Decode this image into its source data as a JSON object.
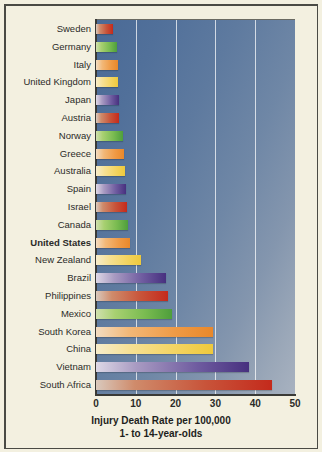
{
  "chart_data": {
    "type": "bar",
    "orientation": "horizontal",
    "title": "",
    "xlabel": "Injury Death Rate per 100,000 1- to 14-year-olds",
    "xlabel_line1": "Injury Death Rate per 100,000",
    "xlabel_line2": "1- to 14-year-olds",
    "ylabel": "",
    "xlim": [
      0,
      50
    ],
    "xticks": [
      0,
      10,
      20,
      30,
      40,
      50
    ],
    "xtick_labels": [
      "0",
      "10",
      "20",
      "30",
      "40",
      "50"
    ],
    "grid": "vertical-gridlines-white",
    "legend": "none",
    "highlighted_category": "United States",
    "categories": [
      "Sweden",
      "Germany",
      "Italy",
      "United Kingdom",
      "Japan",
      "Austria",
      "Norway",
      "Greece",
      "Australia",
      "Spain",
      "Israel",
      "Canada",
      "United States",
      "New Zealand",
      "Brazil",
      "Philippines",
      "Mexico",
      "South Korea",
      "China",
      "Vietnam",
      "South Africa"
    ],
    "values": [
      4.3,
      5.4,
      5.5,
      5.6,
      5.7,
      5.9,
      6.7,
      7.0,
      7.4,
      7.5,
      7.7,
      8.0,
      8.5,
      11.2,
      17.5,
      18.2,
      19.0,
      29.3,
      29.5,
      38.5,
      44.2
    ],
    "bar_colors": [
      "red",
      "green",
      "orange",
      "yellow",
      "purple",
      "red",
      "green",
      "orange",
      "yellow",
      "purple",
      "red",
      "green",
      "orange",
      "yellow",
      "purple",
      "red",
      "green",
      "orange",
      "yellow",
      "purple",
      "red"
    ],
    "palette": {
      "red": "#c42a1c",
      "green": "#4e9e3c",
      "orange": "#e9882a",
      "yellow": "#eec93c",
      "purple": "#47307f",
      "plot_background_dark": "#4a6a96",
      "plot_background_light": "#a8b2c0",
      "page_background": "#f3f0e0",
      "gridline": "#ffffff",
      "text": "#2b2b28"
    }
  }
}
